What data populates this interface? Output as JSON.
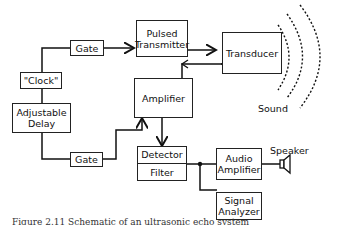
{
  "diagram": {
    "blocks": {
      "gate_top": "Gate",
      "pulsed_transmitter_line1": "Pulsed",
      "pulsed_transmitter_line2": "Transmitter",
      "transducer": "Transducer",
      "clock": "\"Clock\"",
      "amplifier": "Amplifier",
      "adjustable_delay_line1": "Adjustable",
      "adjustable_delay_line2": "Delay",
      "gate_bottom": "Gate",
      "detector": "Detector",
      "filter": "Filter",
      "audio_amplifier_line1": "Audio",
      "audio_amplifier_line2": "Amplifier",
      "signal_analyzer_line1": "Signal",
      "signal_analyzer_line2": "Analyzer"
    },
    "labels": {
      "sound": "Sound",
      "speaker": "Speaker"
    },
    "caption": "Figure 2.11   Schematic of an ultrasonic echo system"
  }
}
